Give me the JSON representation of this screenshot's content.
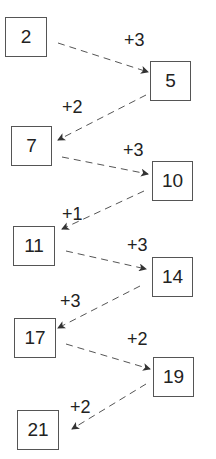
{
  "sequence": [
    {
      "value": "2",
      "x": 5,
      "y": 17,
      "w": 42,
      "h": 40
    },
    {
      "value": "5",
      "x": 150,
      "y": 61,
      "w": 41,
      "h": 40
    },
    {
      "value": "7",
      "x": 11,
      "y": 126,
      "w": 41,
      "h": 40
    },
    {
      "value": "10",
      "x": 152,
      "y": 161,
      "w": 41,
      "h": 40
    },
    {
      "value": "11",
      "x": 13,
      "y": 226,
      "w": 42,
      "h": 40
    },
    {
      "value": "14",
      "x": 152,
      "y": 257,
      "w": 41,
      "h": 40
    },
    {
      "value": "17",
      "x": 14,
      "y": 318,
      "w": 42,
      "h": 40
    },
    {
      "value": "19",
      "x": 153,
      "y": 357,
      "w": 41,
      "h": 40
    },
    {
      "value": "21",
      "x": 17,
      "y": 410,
      "w": 42,
      "h": 40
    }
  ],
  "steps": [
    {
      "label": "+3",
      "x": 124,
      "y": 31
    },
    {
      "label": "+2",
      "x": 62,
      "y": 98
    },
    {
      "label": "+3",
      "x": 123,
      "y": 141
    },
    {
      "label": "+1",
      "x": 62,
      "y": 205
    },
    {
      "label": "+3",
      "x": 127,
      "y": 236
    },
    {
      "label": "+3",
      "x": 60,
      "y": 292
    },
    {
      "label": "+2",
      "x": 127,
      "y": 330
    },
    {
      "label": "+2",
      "x": 70,
      "y": 398
    }
  ],
  "arrows": [
    {
      "x1": 58,
      "y1": 43,
      "x2": 148,
      "y2": 72
    },
    {
      "x1": 146,
      "y1": 95,
      "x2": 58,
      "y2": 140
    },
    {
      "x1": 62,
      "y1": 157,
      "x2": 148,
      "y2": 174
    },
    {
      "x1": 144,
      "y1": 191,
      "x2": 62,
      "y2": 229
    },
    {
      "x1": 66,
      "y1": 251,
      "x2": 146,
      "y2": 269
    },
    {
      "x1": 140,
      "y1": 286,
      "x2": 58,
      "y2": 328
    },
    {
      "x1": 66,
      "y1": 344,
      "x2": 150,
      "y2": 369
    },
    {
      "x1": 146,
      "y1": 384,
      "x2": 72,
      "y2": 429
    }
  ]
}
